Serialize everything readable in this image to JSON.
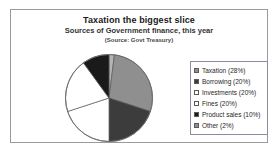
{
  "frame": {
    "border_color": "#9a9a9a"
  },
  "chart_data": {
    "type": "pie",
    "title": "Taxation the biggest slice",
    "subtitle": "Sources of Government finance, this year",
    "source": "(Source: Govt Treasury)",
    "xlabel": "",
    "ylabel": "",
    "grid": false,
    "legend_position": "right",
    "start_angle_deg": 0,
    "direction": "clockwise",
    "categories": [
      "Taxation",
      "Borrowing",
      "Investments",
      "Fines",
      "Product sales",
      "Other"
    ],
    "values": [
      28,
      20,
      20,
      20,
      10,
      2
    ],
    "units": "%",
    "colors": [
      "#8f8f8f",
      "#3c3c3c",
      "#ffffff",
      "#ffffff",
      "#1a1a1a",
      "#b4b4b4"
    ],
    "legend_entries": [
      {
        "label": "Taxation (28%)",
        "swatch": "#8f8f8f"
      },
      {
        "label": "Borrowing (20%)",
        "swatch": "#3c3c3c"
      },
      {
        "label": "Investments (20%)",
        "swatch": "#ffffff"
      },
      {
        "label": "Fines (20%)",
        "swatch": "#ffffff"
      },
      {
        "label": "Product sales (10%)",
        "swatch": "#1a1a1a"
      },
      {
        "label": "Other (2%)",
        "swatch": "#8f8f8f"
      }
    ],
    "slice_order_clockwise_from_top": [
      "Other",
      "Taxation",
      "Borrowing",
      "Fines",
      "Investments",
      "Product sales"
    ]
  }
}
